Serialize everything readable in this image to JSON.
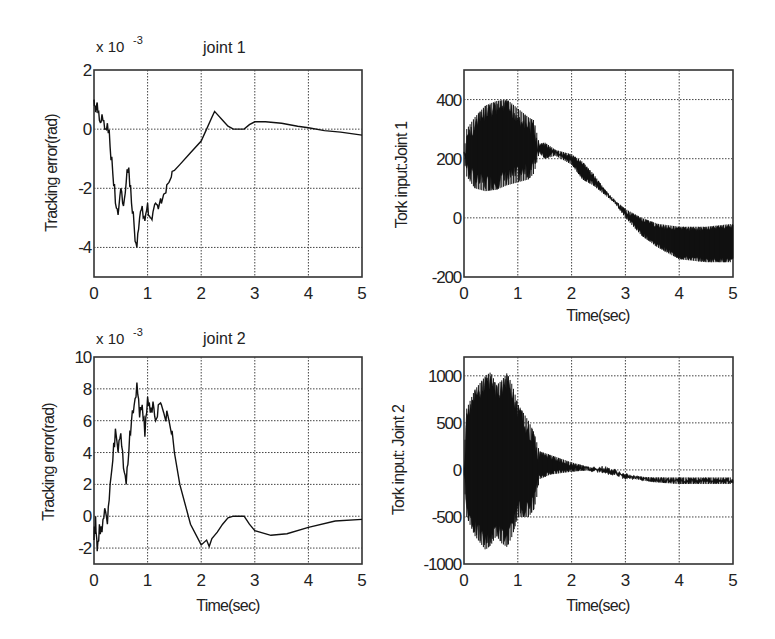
{
  "chart_data": [
    {
      "id": "joint1-error",
      "type": "line",
      "title": "joint 1",
      "xlabel": "",
      "ylabel": "Tracking error(rad)",
      "y_multiplier": "x 10^-3",
      "xlim": [
        0,
        5
      ],
      "ylim": [
        -5,
        2
      ],
      "xticks": [
        0,
        1,
        2,
        3,
        4,
        5
      ],
      "yticks": [
        -4,
        -2,
        0,
        2
      ],
      "grid": true,
      "series": [
        {
          "name": "tracking error joint 1 (x1e-3 rad)",
          "x": [
            0,
            0.03,
            0.06,
            0.1,
            0.15,
            0.2,
            0.25,
            0.3,
            0.35,
            0.4,
            0.45,
            0.5,
            0.55,
            0.6,
            0.65,
            0.7,
            0.75,
            0.8,
            0.85,
            0.9,
            0.95,
            1.0,
            1.05,
            1.1,
            1.15,
            1.2,
            1.3,
            1.4,
            1.5,
            1.6,
            1.8,
            2.0,
            2.1,
            2.2,
            2.25,
            2.3,
            2.4,
            2.5,
            2.6,
            2.7,
            2.8,
            2.9,
            3.0,
            3.2,
            3.5,
            3.8,
            4.0,
            4.3,
            4.6,
            5.0
          ],
          "y": [
            1.0,
            0.6,
            0.9,
            0.3,
            0.5,
            0.0,
            0.2,
            -0.6,
            -1.5,
            -2.5,
            -2.9,
            -2.0,
            -2.6,
            -1.8,
            -1.3,
            -2.5,
            -3.3,
            -4.0,
            -3.0,
            -2.6,
            -3.1,
            -2.5,
            -3.0,
            -2.8,
            -2.5,
            -2.7,
            -2.2,
            -1.8,
            -1.4,
            -1.2,
            -0.8,
            -0.4,
            0.0,
            0.4,
            0.6,
            0.5,
            0.3,
            0.1,
            0.0,
            0.0,
            0.0,
            0.15,
            0.25,
            0.25,
            0.2,
            0.1,
            0.05,
            -0.05,
            -0.1,
            -0.2
          ]
        }
      ]
    },
    {
      "id": "joint1-torque",
      "type": "area",
      "title": "",
      "xlabel": "Time(sec)",
      "ylabel": "Tork input:Joint 1",
      "xlim": [
        0,
        5
      ],
      "ylim": [
        -200,
        500
      ],
      "xticks": [
        0,
        1,
        2,
        3,
        4,
        5
      ],
      "yticks": [
        -200,
        0,
        200,
        400
      ],
      "grid": true,
      "series": [
        {
          "name": "torque envelope upper",
          "x": [
            0,
            0.05,
            0.2,
            0.4,
            0.6,
            0.8,
            1.0,
            1.2,
            1.3,
            1.4,
            1.5,
            1.7,
            2.0,
            2.2,
            2.4,
            2.6,
            2.8,
            3.0,
            3.3,
            3.6,
            4.0,
            4.5,
            5.0
          ],
          "y": [
            220,
            300,
            340,
            380,
            395,
            400,
            370,
            340,
            330,
            250,
            255,
            230,
            215,
            190,
            150,
            100,
            60,
            30,
            0,
            -20,
            -30,
            -30,
            -20
          ]
        },
        {
          "name": "torque envelope lower",
          "x": [
            0,
            0.05,
            0.2,
            0.4,
            0.6,
            0.8,
            1.0,
            1.2,
            1.3,
            1.4,
            1.5,
            1.7,
            2.0,
            2.2,
            2.4,
            2.6,
            2.8,
            3.0,
            3.3,
            3.6,
            4.0,
            4.5,
            5.0
          ],
          "y": [
            200,
            140,
            100,
            90,
            95,
            110,
            120,
            130,
            150,
            220,
            200,
            210,
            180,
            130,
            110,
            80,
            50,
            0,
            -60,
            -100,
            -140,
            -150,
            -150
          ]
        }
      ]
    },
    {
      "id": "joint2-error",
      "type": "line",
      "title": "joint 2",
      "xlabel": "Time(sec)",
      "ylabel": "Tracking error(rad)",
      "y_multiplier": "x 10^-3",
      "xlim": [
        0,
        5
      ],
      "ylim": [
        -3,
        10
      ],
      "xticks": [
        0,
        1,
        2,
        3,
        4,
        5
      ],
      "yticks": [
        -2,
        0,
        2,
        4,
        6,
        8,
        10
      ],
      "grid": true,
      "series": [
        {
          "name": "tracking error joint 2 (x1e-3 rad)",
          "x": [
            0,
            0.03,
            0.06,
            0.1,
            0.15,
            0.2,
            0.25,
            0.3,
            0.35,
            0.4,
            0.45,
            0.5,
            0.55,
            0.6,
            0.65,
            0.7,
            0.75,
            0.8,
            0.85,
            0.9,
            0.95,
            1.0,
            1.05,
            1.1,
            1.15,
            1.2,
            1.3,
            1.4,
            1.5,
            1.6,
            1.8,
            2.0,
            2.1,
            2.15,
            2.2,
            2.3,
            2.4,
            2.5,
            2.6,
            2.7,
            2.8,
            2.9,
            3.0,
            3.3,
            3.6,
            4.0,
            4.5,
            5.0
          ],
          "y": [
            -1.5,
            0.0,
            -2.2,
            -0.5,
            -1.0,
            0.5,
            -0.5,
            2.0,
            3.5,
            5.5,
            4.0,
            5.2,
            3.0,
            2.0,
            4.0,
            6.0,
            7.0,
            8.4,
            6.2,
            7.0,
            5.0,
            7.5,
            6.5,
            7.2,
            6.0,
            7.0,
            6.5,
            6.0,
            4.0,
            2.0,
            -0.5,
            -1.8,
            -1.5,
            -1.9,
            -1.4,
            -1.0,
            -0.5,
            -0.1,
            0.0,
            0.0,
            0.0,
            -0.5,
            -0.9,
            -1.2,
            -1.1,
            -0.7,
            -0.3,
            -0.2
          ]
        }
      ]
    },
    {
      "id": "joint2-torque",
      "type": "area",
      "title": "",
      "xlabel": "Time(sec)",
      "ylabel": "Tork input: Joint 2",
      "xlim": [
        0,
        5
      ],
      "ylim": [
        -1000,
        1200
      ],
      "xticks": [
        0,
        1,
        2,
        3,
        4,
        5
      ],
      "yticks": [
        -1000,
        -500,
        0,
        500,
        1000
      ],
      "grid": true,
      "series": [
        {
          "name": "torque envelope upper",
          "x": [
            0,
            0.05,
            0.2,
            0.4,
            0.5,
            0.6,
            0.7,
            0.8,
            0.9,
            1.0,
            1.2,
            1.3,
            1.35,
            1.4,
            1.6,
            2.0,
            2.4,
            2.6,
            2.8,
            3.0,
            3.5,
            4.0,
            5.0
          ],
          "y": [
            100,
            650,
            850,
            1000,
            1040,
            900,
            950,
            1030,
            900,
            700,
            520,
            400,
            300,
            200,
            160,
            80,
            20,
            0,
            -20,
            -60,
            -80,
            -80,
            -80
          ],
          "min_note": "band"
        },
        {
          "name": "torque envelope lower",
          "x": [
            0,
            0.05,
            0.2,
            0.4,
            0.5,
            0.6,
            0.7,
            0.8,
            0.9,
            1.0,
            1.2,
            1.3,
            1.35,
            1.4,
            1.6,
            2.0,
            2.4,
            2.6,
            2.8,
            3.0,
            3.5,
            4.0,
            5.0
          ],
          "y": [
            -100,
            -500,
            -700,
            -850,
            -800,
            -700,
            -780,
            -820,
            -700,
            -500,
            -500,
            -420,
            -300,
            -100,
            -50,
            -20,
            0,
            0,
            -30,
            -80,
            -130,
            -150,
            -150
          ]
        }
      ]
    }
  ],
  "plots": {
    "p1": {
      "title": "joint 1",
      "exponent_base": "x 10",
      "exponent": "-3",
      "ylabel": "Tracking error(rad)",
      "xlabel": ""
    },
    "p2": {
      "title": "",
      "ylabel": "Tork input:Joint 1",
      "xlabel": "Time(sec)"
    },
    "p3": {
      "title": "joint 2",
      "exponent_base": "x 10",
      "exponent": "-3",
      "ylabel": "Tracking error(rad)",
      "xlabel": "Time(sec)"
    },
    "p4": {
      "title": "",
      "ylabel": "Tork input: Joint 2",
      "xlabel": "Time(sec)"
    }
  }
}
